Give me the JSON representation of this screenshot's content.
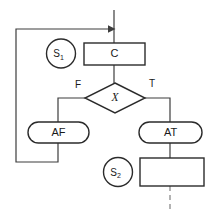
{
  "diagram": {
    "colors": {
      "background": "#ffffff",
      "node_stroke": "#2b2b2b",
      "connector": "#3d3d3d",
      "dashed_connector": "#8a8a8a",
      "text": "#1a1a1a"
    },
    "nodes": {
      "state_1": {
        "label": "S",
        "subscript": "1",
        "shape": "circle"
      },
      "state_2": {
        "label": "S",
        "subscript": "2",
        "shape": "circle"
      },
      "condition_box": {
        "label": "C",
        "shape": "rectangle"
      },
      "decision": {
        "label": "X",
        "shape": "diamond"
      },
      "action_false": {
        "label": "AF",
        "shape": "stadium"
      },
      "action_true": {
        "label": "AT",
        "shape": "stadium"
      },
      "next_box": {
        "label": "",
        "shape": "rectangle"
      }
    },
    "edges": {
      "false_branch_label": "F",
      "true_branch_label": "T"
    }
  }
}
